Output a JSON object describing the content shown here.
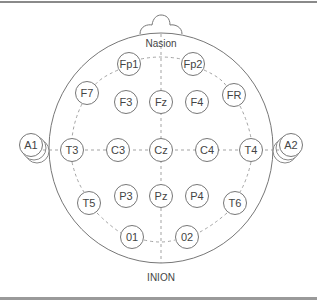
{
  "diagram": {
    "landmarks": {
      "top": "Nasion",
      "bottom": "INION"
    },
    "colors": {
      "stroke": "#777777",
      "dash": "#999999",
      "text": "#444444",
      "background": "#ffffff"
    },
    "electrodes": [
      {
        "id": "Fp1",
        "label": "Fp1",
        "x": 129,
        "y": 64
      },
      {
        "id": "Fp2",
        "label": "Fp2",
        "x": 193,
        "y": 64
      },
      {
        "id": "F7",
        "label": "F7",
        "x": 87,
        "y": 93
      },
      {
        "id": "F3",
        "label": "F3",
        "x": 126,
        "y": 102
      },
      {
        "id": "Fz",
        "label": "Fz",
        "x": 161,
        "y": 102
      },
      {
        "id": "F4",
        "label": "F4",
        "x": 197,
        "y": 102
      },
      {
        "id": "FR",
        "label": "FR",
        "x": 234,
        "y": 95
      },
      {
        "id": "A1",
        "label": "A1",
        "x": 31,
        "y": 145
      },
      {
        "id": "T3",
        "label": "T3",
        "x": 72,
        "y": 150
      },
      {
        "id": "C3",
        "label": "C3",
        "x": 118,
        "y": 150
      },
      {
        "id": "Cz",
        "label": "Cz",
        "x": 161,
        "y": 150
      },
      {
        "id": "C4",
        "label": "C4",
        "x": 207,
        "y": 150
      },
      {
        "id": "T4",
        "label": "T4",
        "x": 251,
        "y": 150
      },
      {
        "id": "A2",
        "label": "A2",
        "x": 291,
        "y": 145
      },
      {
        "id": "T5",
        "label": "T5",
        "x": 89,
        "y": 203
      },
      {
        "id": "P3",
        "label": "P3",
        "x": 126,
        "y": 196
      },
      {
        "id": "Pz",
        "label": "Pz",
        "x": 161,
        "y": 196
      },
      {
        "id": "P4",
        "label": "P4",
        "x": 197,
        "y": 196
      },
      {
        "id": "T6",
        "label": "T6",
        "x": 235,
        "y": 203
      },
      {
        "id": "O1",
        "label": "01",
        "x": 132,
        "y": 237
      },
      {
        "id": "O2",
        "label": "02",
        "x": 187,
        "y": 237
      }
    ]
  }
}
